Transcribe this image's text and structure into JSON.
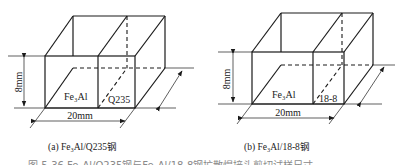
{
  "figure": {
    "panels": [
      {
        "id": "a",
        "caption": "(a) Fe₃Al/Q235钢",
        "height_label": "8mm",
        "width_label": "20mm",
        "left_material": "Fe₃Al",
        "right_material": "Q235"
      },
      {
        "id": "b",
        "caption": "(b) Fe₃Al/18-8钢",
        "height_label": "8mm",
        "width_label": "20mm",
        "left_material": "Fe₃Al",
        "right_material": "18-8"
      }
    ],
    "bottom_caption_partial": "图 5-36  Fe₃Al/Q235钢与Fe₃Al/18-8钢扩散焊接头剪切试样尺寸",
    "colors": {
      "line": "#1a1a1a",
      "background": "#ffffff"
    }
  }
}
